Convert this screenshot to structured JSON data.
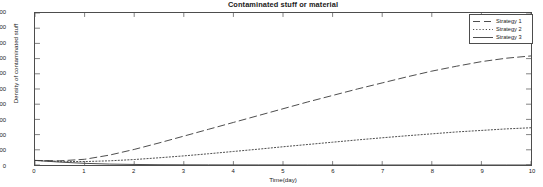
{
  "chart_data": {
    "type": "line",
    "title": "Contaminated stuff or material",
    "xlabel": "Time(day)",
    "ylabel": "Density of contaminated stuff",
    "xlim": [
      0,
      10
    ],
    "ylim": [
      0,
      2000
    ],
    "xticks": [
      0,
      1,
      2,
      3,
      4,
      5,
      6,
      7,
      8,
      9,
      10
    ],
    "yticks": [
      0,
      200,
      400,
      600,
      800,
      1000,
      1200,
      1400,
      1600,
      1800,
      2000
    ],
    "grid": false,
    "legend_position": "top-right",
    "x": [
      0,
      0.5,
      1,
      1.5,
      2,
      2.5,
      3,
      3.5,
      4,
      4.5,
      5,
      5.5,
      6,
      6.5,
      7,
      7.5,
      8,
      8.5,
      9,
      9.5,
      10
    ],
    "series": [
      {
        "name": "Strategy 1",
        "style": "dashed",
        "color": "#3a3a3a",
        "values": [
          60,
          55,
          75,
          130,
          205,
          290,
          380,
          470,
          560,
          650,
          740,
          830,
          915,
          1000,
          1080,
          1160,
          1235,
          1300,
          1360,
          1405,
          1435
        ]
      },
      {
        "name": "Strategy 2",
        "style": "dotted",
        "color": "#3a3a3a",
        "values": [
          60,
          48,
          45,
          55,
          72,
          95,
          120,
          148,
          178,
          208,
          240,
          270,
          300,
          330,
          358,
          385,
          410,
          435,
          455,
          475,
          490
        ]
      },
      {
        "name": "Strategy 3",
        "style": "solid",
        "color": "#3a3a3a",
        "values": [
          60,
          38,
          22,
          12,
          7,
          4,
          3,
          2,
          1.5,
          1,
          1,
          0.5,
          0.5,
          0.5,
          0,
          0,
          0,
          0,
          0,
          0,
          0
        ]
      }
    ]
  },
  "legend": {
    "items": [
      {
        "label": "Strategy 1"
      },
      {
        "label": "Strategy 2"
      },
      {
        "label": "Strategy 3"
      }
    ]
  }
}
